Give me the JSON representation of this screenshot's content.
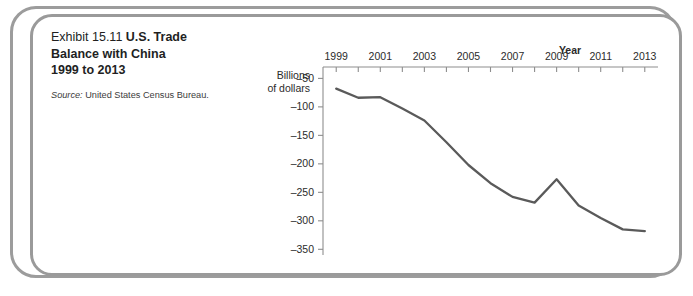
{
  "exhibit": {
    "number": "Exhibit 15.11",
    "title_rest": "U.S. Trade Balance with China 1999 to 2013",
    "title_line1_num": "Exhibit 15.11 ",
    "title_line1_rest": "U.S. Trade",
    "title_line2": "Balance with China",
    "title_line3": "1999 to 2013",
    "source_label": "Source:",
    "source_text": " United States Census Bureau."
  },
  "ghost_text": {
    "lines": [
      "applying online   the   ofter a",
      "speci    had done a   selfemploying we",
      "from             it        he for",
      "her    of a rd g    soon",
      "somewhere  with   billion"
    ]
  },
  "chart_data": {
    "type": "line",
    "xlabel": "Year",
    "ylabel": "Billions of dollars",
    "ylabel_line1": "Billions",
    "ylabel_line2": "of dollars",
    "x": [
      1999,
      2000,
      2001,
      2002,
      2003,
      2004,
      2005,
      2006,
      2007,
      2008,
      2009,
      2010,
      2011,
      2012,
      2013
    ],
    "values": [
      -68,
      -84,
      -83,
      -103,
      -124,
      -162,
      -202,
      -234,
      -258,
      -268,
      -227,
      -273,
      -295,
      -315,
      -318
    ],
    "xtick_labels": [
      "1999",
      "2001",
      "2003",
      "2005",
      "2007",
      "2009",
      "2011",
      "2013"
    ],
    "xtick_years": [
      1999,
      2001,
      2003,
      2005,
      2007,
      2009,
      2011,
      2013
    ],
    "ytick_labels": [
      "–50",
      "–100",
      "–150",
      "–200",
      "–250",
      "–300",
      "–350"
    ],
    "ytick_values": [
      -50,
      -100,
      -150,
      -200,
      -250,
      -300,
      -350
    ],
    "xlim": [
      1998.4,
      2013.6
    ],
    "ylim": [
      -360,
      -30
    ],
    "grid": false,
    "legend": false,
    "line_color": "#5a5a5a",
    "axis_color": "#8e8e8e",
    "axis_position": "top"
  },
  "colors": {
    "frame": "#9a9a9a",
    "text": "#221f1f",
    "line": "#5a5a5a"
  }
}
